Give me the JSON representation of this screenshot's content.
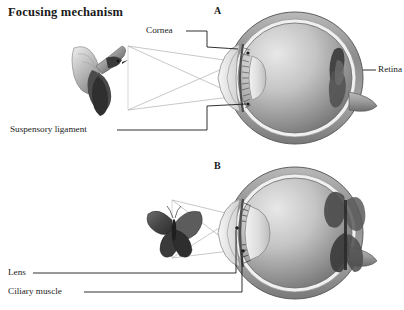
{
  "figure": {
    "title": "Focusing mechanism",
    "background_color": "#ffffff",
    "ink_color": "#1a1a1a"
  },
  "panels": [
    {
      "letter": "A",
      "subject": "bird",
      "description": "distant object, lens flattened"
    },
    {
      "letter": "B",
      "subject": "butterfly",
      "description": "near object, lens rounded"
    }
  ],
  "labels": {
    "cornea": "Cornea",
    "retina": "Retina",
    "suspensory_ligament": "Suspensory ligament",
    "lens": "Lens",
    "ciliary_muscle": "Ciliary muscle"
  },
  "icons": {
    "bird": "bird-icon",
    "butterfly": "butterfly-icon",
    "eye_a": "eye-cross-section-icon",
    "eye_b": "eye-cross-section-icon"
  },
  "colors": {
    "sclera": "#8e8e8e",
    "sclera_light": "#c9c9c9",
    "vitreous_light": "#dcdcdc",
    "vitreous_dark": "#7c7c7c",
    "retina_dark": "#4a4a4a",
    "ray": "#9a9a9a",
    "leader": "#1a1a1a"
  }
}
